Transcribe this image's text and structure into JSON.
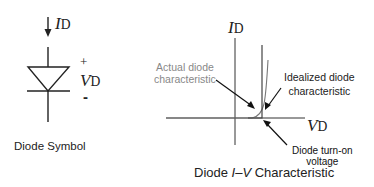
{
  "diode_symbol": {
    "current_label": "I",
    "current_sub": "D",
    "plus": "+",
    "voltage_label": "V",
    "voltage_sub": "D",
    "minus": "-",
    "caption": "Diode Symbol"
  },
  "iv_chart": {
    "y_axis_label": "I",
    "y_axis_sub": "D",
    "x_axis_label": "V",
    "x_axis_sub": "D",
    "annotations": {
      "actual_line1": "Actual diode",
      "actual_line2": "characteristic",
      "ideal_line1": "Idealized diode",
      "ideal_line2": "characteristic",
      "turn_on_line1": "Diode turn-on",
      "turn_on_line2": "voltage"
    },
    "caption_prefix": "Diode ",
    "caption_italic": "I–V",
    "caption_suffix": " Characteristic"
  },
  "colors": {
    "ink": "#222222",
    "annotation_gray": "#888888",
    "curve_gray": "#777777"
  }
}
